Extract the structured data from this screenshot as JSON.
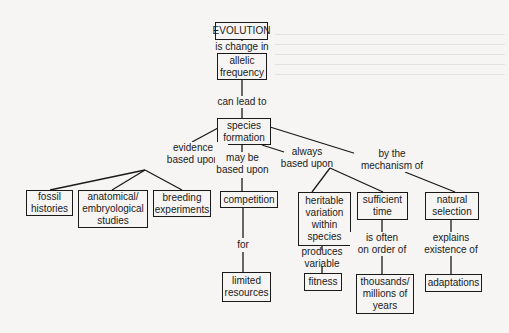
{
  "diagram": {
    "type": "concept-map",
    "nodes": {
      "evolution": "EVOLUTION",
      "allelic_frequency": "allelic\nfrequency",
      "species_formation": "species\nformation",
      "fossil_histories": "fossil\nhistories",
      "anatomical_studies": "anatomical/\nembryological\nstudies",
      "breeding_experiments": "breeding\nexperiments",
      "competition": "competition",
      "limited_resources": "limited\nresources",
      "heritable_variation": "heritable\nvariation\nwithin\nspecies",
      "sufficient_time": "sufficient\ntime",
      "natural_selection": "natural\nselection",
      "fitness": "fitness",
      "thousands_years": "thousands/\nmillions of\nyears",
      "adaptations": "adaptations"
    },
    "links": {
      "is_change_in": "is change in",
      "can_lead_to": "can lead to",
      "evidence_based_upon": "evidence\nbased upon",
      "may_be_based_upon": "may be\nbased upon",
      "always_based_upon": "always\nbased upon",
      "by_mechanism_of": "by the\nmechanism of",
      "for": "for",
      "produces_variable": "produces\nvariable",
      "is_often_on_order_of": "is often\non order of",
      "explains_existence_of": "explains\nexistence of"
    },
    "edges": [
      [
        "evolution",
        "is_change_in",
        "allelic_frequency"
      ],
      [
        "allelic_frequency",
        "can_lead_to",
        "species_formation"
      ],
      [
        "species_formation",
        "evidence_based_upon",
        "fossil_histories"
      ],
      [
        "species_formation",
        "evidence_based_upon",
        "anatomical_studies"
      ],
      [
        "species_formation",
        "evidence_based_upon",
        "breeding_experiments"
      ],
      [
        "species_formation",
        "may_be_based_upon",
        "competition"
      ],
      [
        "species_formation",
        "always_based_upon",
        "heritable_variation"
      ],
      [
        "species_formation",
        "always_based_upon",
        "sufficient_time"
      ],
      [
        "species_formation",
        "by_mechanism_of",
        "natural_selection"
      ],
      [
        "competition",
        "for",
        "limited_resources"
      ],
      [
        "heritable_variation",
        "produces_variable",
        "fitness"
      ],
      [
        "sufficient_time",
        "is_often_on_order_of",
        "thousands_years"
      ],
      [
        "natural_selection",
        "explains_existence_of",
        "adaptations"
      ]
    ]
  }
}
